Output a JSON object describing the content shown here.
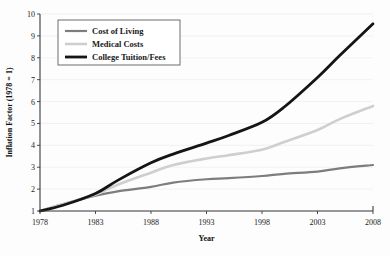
{
  "chart_data": {
    "type": "line",
    "title": "",
    "xlabel": "Year",
    "ylabel": "Inflation Factor (1978 = 1)",
    "xlim": [
      1978,
      2008
    ],
    "ylim": [
      1,
      10
    ],
    "xticks": [
      1978,
      1983,
      1988,
      1993,
      1998,
      2003,
      2008
    ],
    "yticks": [
      1,
      2,
      3,
      4,
      5,
      6,
      7,
      8,
      9,
      10
    ],
    "grid": true,
    "legend_position": "top-left",
    "x": [
      1978,
      1980,
      1983,
      1985,
      1988,
      1990,
      1993,
      1995,
      1998,
      2000,
      2003,
      2005,
      2008
    ],
    "series": [
      {
        "name": "Cost of Living",
        "color": "#7d7d7d",
        "width": 2.2,
        "values": [
          1.0,
          1.3,
          1.7,
          1.9,
          2.1,
          2.3,
          2.45,
          2.5,
          2.6,
          2.7,
          2.8,
          2.95,
          3.1
        ]
      },
      {
        "name": "Medical Costs",
        "color": "#cfcfcf",
        "width": 2.6,
        "values": [
          1.0,
          1.3,
          1.75,
          2.2,
          2.75,
          3.1,
          3.4,
          3.55,
          3.8,
          4.15,
          4.7,
          5.2,
          5.8
        ]
      },
      {
        "name": "College Tuition/Fees",
        "color": "#151515",
        "width": 2.8,
        "values": [
          1.0,
          1.25,
          1.8,
          2.4,
          3.2,
          3.6,
          4.1,
          4.45,
          5.05,
          5.75,
          7.1,
          8.1,
          9.55
        ]
      }
    ]
  },
  "legend": {
    "entries": [
      {
        "label": "Cost of Living"
      },
      {
        "label": "Medical Costs"
      },
      {
        "label": "College Tuition/Fees"
      }
    ]
  },
  "axes": {
    "y_title": "Inflation Factor (1978 = 1)",
    "x_title": "Year",
    "y_tick_labels": [
      "1",
      "2",
      "3",
      "4",
      "5",
      "6",
      "7",
      "8",
      "9",
      "10"
    ],
    "x_tick_labels": [
      "1978",
      "1983",
      "1988",
      "1993",
      "1998",
      "2003",
      "2008"
    ]
  }
}
